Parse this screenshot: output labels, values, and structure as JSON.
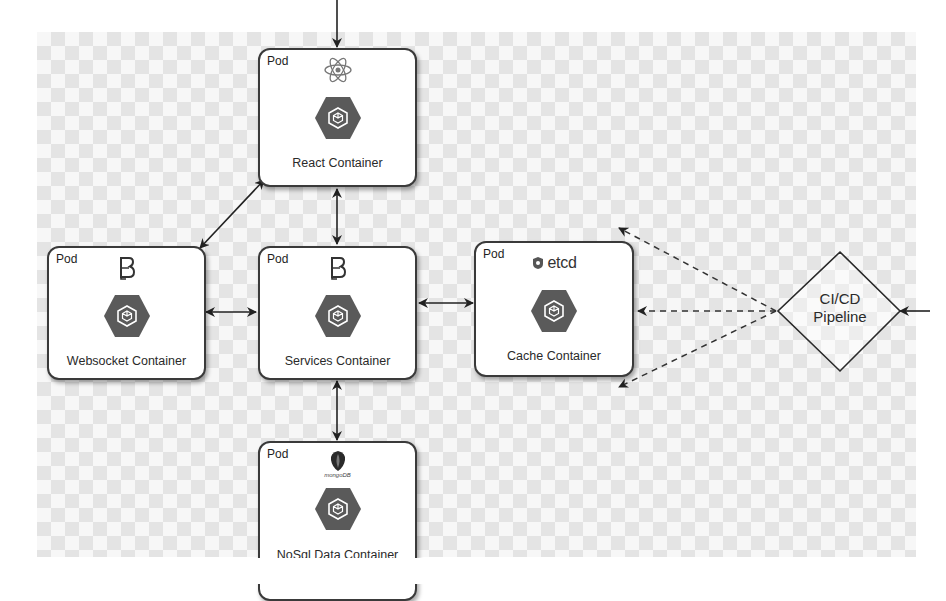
{
  "diagram": {
    "background": "checkerboard",
    "colors": {
      "pod_border": "#3a3a3a",
      "hex_fill": "#5a5a5a",
      "edge": "#2a2a2a"
    },
    "pods": [
      {
        "id": "react",
        "label": "Pod",
        "logo": "react-atom-icon",
        "title": "React Container"
      },
      {
        "id": "websocket",
        "label": "Pod",
        "logo": "bitbucket-b-icon",
        "title": "Websocket Container"
      },
      {
        "id": "services",
        "label": "Pod",
        "logo": "bitbucket-b-icon",
        "title": "Services Container"
      },
      {
        "id": "cache",
        "label": "Pod",
        "logo": "etcd-icon",
        "logo_text": "etcd",
        "title": "Cache Container"
      },
      {
        "id": "nosql",
        "label": "Pod",
        "logo": "mongodb-leaf-icon",
        "logo_text": "mongoDB",
        "title": "NoSql Data Container"
      }
    ],
    "decision": {
      "id": "cicd",
      "line1": "CI/CD",
      "line2": "Pipeline"
    },
    "edges": [
      {
        "from": "external-top",
        "to": "react",
        "style": "solid",
        "direction": "one-way"
      },
      {
        "from": "react",
        "to": "websocket",
        "style": "solid",
        "direction": "bidirectional"
      },
      {
        "from": "react",
        "to": "services",
        "style": "solid",
        "direction": "bidirectional"
      },
      {
        "from": "websocket",
        "to": "services",
        "style": "solid",
        "direction": "bidirectional"
      },
      {
        "from": "services",
        "to": "cache",
        "style": "solid",
        "direction": "bidirectional"
      },
      {
        "from": "services",
        "to": "nosql",
        "style": "solid",
        "direction": "bidirectional"
      },
      {
        "from": "cicd",
        "to": "upper-left",
        "style": "dashed",
        "direction": "one-way"
      },
      {
        "from": "cicd",
        "to": "cache",
        "style": "dashed",
        "direction": "one-way"
      },
      {
        "from": "cicd",
        "to": "lower-left",
        "style": "dashed",
        "direction": "one-way"
      },
      {
        "from": "external-right",
        "to": "cicd",
        "style": "solid",
        "direction": "one-way"
      }
    ]
  }
}
